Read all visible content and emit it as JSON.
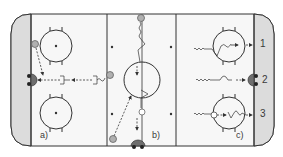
{
  "diagram": {
    "type": "hockey-rink-drill",
    "colors": {
      "ice": "#f7f7f7",
      "end_zone_shade": "#dcdcdc",
      "lines": "#333333",
      "player": "#b0b0b0",
      "goalie": "#6e6e6e"
    },
    "zones": [
      {
        "id": "a",
        "label": "a)"
      },
      {
        "id": "b",
        "label": "b)"
      },
      {
        "id": "c",
        "label": "c)"
      }
    ],
    "rows": [
      {
        "label": "1"
      },
      {
        "label": "2"
      },
      {
        "label": "3"
      }
    ]
  }
}
